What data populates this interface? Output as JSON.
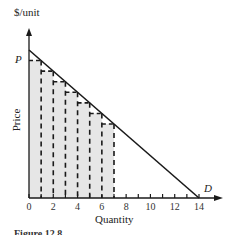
{
  "chart_data": {
    "type": "line",
    "title": "",
    "xlabel": "Quantity",
    "ylabel": "Price",
    "y_unit_label": "$/unit",
    "price_marker_label": "P",
    "demand_label": "D",
    "xlim": [
      0,
      14
    ],
    "x_ticks": [
      0,
      2,
      4,
      6,
      8,
      10,
      12,
      14
    ],
    "x_tick_labels": [
      "0",
      "2",
      "4",
      "6",
      "8",
      "10",
      "12",
      "14"
    ],
    "minor_x_ticks": [
      1,
      3,
      5,
      7,
      9,
      11,
      13
    ],
    "demand_line": {
      "x": [
        0,
        14
      ],
      "y_relative": [
        14,
        0
      ]
    },
    "staircase_steps": [
      {
        "q_from": 0,
        "q_to": 1,
        "level_q": 1
      },
      {
        "q_from": 1,
        "q_to": 2,
        "level_q": 2
      },
      {
        "q_from": 2,
        "q_to": 3,
        "level_q": 3
      },
      {
        "q_from": 3,
        "q_to": 4,
        "level_q": 4
      },
      {
        "q_from": 4,
        "q_to": 5,
        "level_q": 5
      },
      {
        "q_from": 5,
        "q_to": 6,
        "level_q": 6
      },
      {
        "q_from": 6,
        "q_to": 7,
        "level_q": 7
      }
    ],
    "shaded_region": {
      "q_from": 0,
      "q_to": 7,
      "color": "#e6e6e6"
    },
    "grid": false,
    "legend": null,
    "caption": "Figure 12.8"
  },
  "colors": {
    "line": "#1a1a1a",
    "shade": "#e6e6e6",
    "axis": "#1a1a1a"
  }
}
